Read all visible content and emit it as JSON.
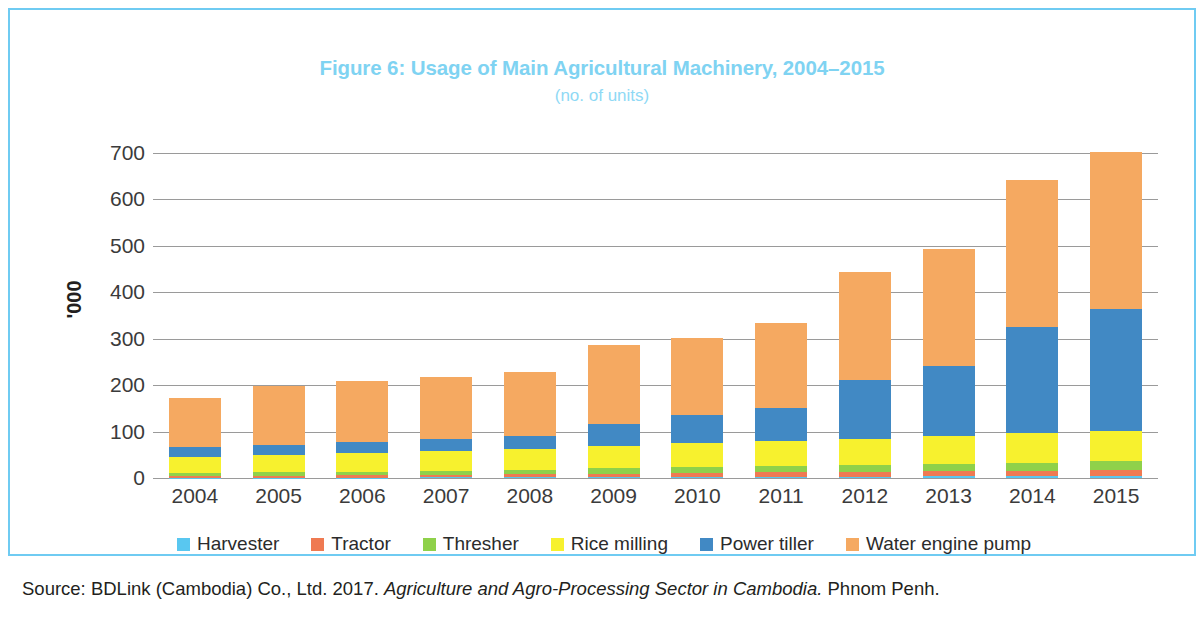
{
  "figure": {
    "title": "Figure 6: Usage of Main Agricultural Machinery, 2004–2015",
    "subtitle": "(no. of units)",
    "y_axis_title": "'000",
    "source_prefix": "Source: BDLink (Cambodia) Co., Ltd. 2017. ",
    "source_italic": "Agriculture and Agro-Processing Sector in Cambodia.",
    "source_suffix": " Phnom Penh."
  },
  "colors": {
    "frame": "#6FCBF2",
    "title": "#7FD3F2",
    "subtitle": "#8FD9F5",
    "harvester": "#59C7F0",
    "tractor": "#EF7A52",
    "thresher": "#8FD14A",
    "rice_milling": "#F7F12E",
    "power_tiller": "#4189C4",
    "water_engine_pump": "#F5A961",
    "gridline": "#9a9a9a",
    "tick_text": "#3b3b3b"
  },
  "chart_data": {
    "type": "bar",
    "stacked": true,
    "title": "Figure 6: Usage of Main Agricultural Machinery, 2004–2015",
    "subtitle": "(no. of units)",
    "xlabel": "",
    "ylabel": "'000",
    "ylim": [
      0,
      700
    ],
    "yticks": [
      0,
      100,
      200,
      300,
      400,
      500,
      600,
      700
    ],
    "ytick_labels": [
      "0",
      "100",
      "200",
      "300",
      "400",
      "500",
      "600",
      "700"
    ],
    "grid": true,
    "legend_position": "bottom",
    "categories": [
      "2004",
      "2005",
      "2006",
      "2007",
      "2008",
      "2009",
      "2010",
      "2011",
      "2012",
      "2013",
      "2014",
      "2015"
    ],
    "series": [
      {
        "name": "Harvester",
        "color": "#59C7F0",
        "values": [
          1,
          1,
          1,
          2,
          2,
          2,
          3,
          3,
          3,
          4,
          4,
          5
        ]
      },
      {
        "name": "Tractor",
        "color": "#EF7A52",
        "values": [
          4,
          4,
          5,
          5,
          6,
          7,
          8,
          9,
          10,
          11,
          12,
          13
        ]
      },
      {
        "name": "Thresher",
        "color": "#8FD14A",
        "values": [
          6,
          7,
          8,
          9,
          10,
          12,
          13,
          14,
          15,
          16,
          17,
          18
        ]
      },
      {
        "name": "Rice milling",
        "color": "#F7F12E",
        "values": [
          35,
          38,
          40,
          42,
          44,
          48,
          51,
          54,
          57,
          60,
          63,
          66
        ]
      },
      {
        "name": "Power tiller",
        "color": "#4189C4",
        "values": [
          20,
          22,
          24,
          26,
          28,
          48,
          60,
          70,
          127,
          150,
          229,
          263
        ]
      },
      {
        "name": "Water engine pump",
        "color": "#F5A961",
        "values": [
          107,
          127,
          130,
          134,
          138,
          170,
          167,
          184,
          231,
          252,
          317,
          338
        ]
      }
    ],
    "totals": [
      173,
      199,
      208,
      218,
      228,
      287,
      302,
      334,
      443,
      493,
      642,
      703
    ]
  },
  "legend": {
    "items": [
      {
        "label": "Harvester",
        "color": "#59C7F0"
      },
      {
        "label": "Tractor",
        "color": "#EF7A52"
      },
      {
        "label": "Thresher",
        "color": "#8FD14A"
      },
      {
        "label": "Rice milling",
        "color": "#F7F12E"
      },
      {
        "label": "Power tiller",
        "color": "#4189C4"
      },
      {
        "label": "Water engine pump",
        "color": "#F5A961"
      }
    ]
  }
}
